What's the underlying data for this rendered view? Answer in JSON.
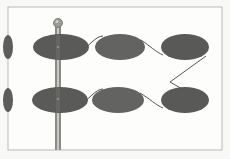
{
  "diagram": {
    "colors": {
      "background": "#f8f8f6",
      "frame": "#b9b9b6",
      "disk_fill": "#5d5d5b",
      "disk_dark": "#4e4e4c",
      "pole": "#8a8a87",
      "pole_highlight": "#c8c8c4",
      "string": "#555553"
    },
    "frame": {
      "x": 8,
      "y": 7,
      "width": 214,
      "height": 143
    },
    "pole": {
      "x": 58,
      "top": 22,
      "bottom": 150,
      "ball_radius": 4.5
    },
    "rows": [
      {
        "name": "top-row",
        "cy": 47,
        "disks": [
          {
            "cx": 8,
            "rx": 5,
            "ry": 12,
            "partial": true
          },
          {
            "cx": 61,
            "rx": 28,
            "ry": 13
          },
          {
            "cx": 120,
            "rx": 25,
            "ry": 13
          },
          {
            "cx": 185,
            "rx": 24,
            "ry": 13
          }
        ]
      },
      {
        "name": "bottom-row",
        "cy": 100,
        "disks": [
          {
            "cx": 8,
            "rx": 5,
            "ry": 12,
            "partial": true
          },
          {
            "cx": 60,
            "rx": 28,
            "ry": 13
          },
          {
            "cx": 118,
            "rx": 26,
            "ry": 13
          },
          {
            "cx": 185,
            "rx": 24,
            "ry": 13
          }
        ]
      }
    ],
    "string_path": "M78 56 C 92 48, 100 34, 116 36 C 132 38, 150 56, 168 56 L 209 52 L 170 80 L 206 100 M78 110 C 92 102, 100 88, 116 89 C 132 90, 150 108, 168 110"
  }
}
